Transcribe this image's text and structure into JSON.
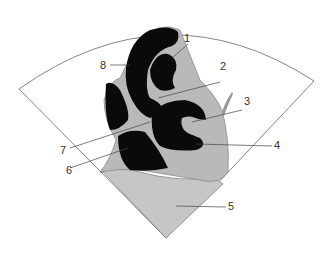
{
  "diagram": {
    "type": "echocardiographic-sector-schematic",
    "colors": {
      "background": "#ffffff",
      "chamber": "#0a0a0a",
      "tissue": "#b9b9b9",
      "liver": "#c6c6c6",
      "outline": "#555555",
      "leader": "#444444"
    },
    "labels": [
      {
        "id": "1",
        "text": "1"
      },
      {
        "id": "2",
        "text": "2"
      },
      {
        "id": "3",
        "text": "3"
      },
      {
        "id": "4",
        "text": "4"
      },
      {
        "id": "5",
        "text": "5"
      },
      {
        "id": "6",
        "text": "6"
      },
      {
        "id": "7",
        "text": "7"
      },
      {
        "id": "8",
        "text": "8"
      }
    ]
  }
}
